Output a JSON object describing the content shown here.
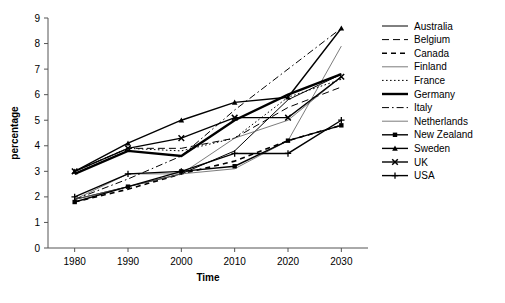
{
  "chart_data": {
    "type": "line",
    "title": "",
    "xlabel": "Time",
    "ylabel": "percentage",
    "x": [
      1980,
      1990,
      2000,
      2010,
      2020,
      2030
    ],
    "categories": [
      "1980",
      "1990",
      "2000",
      "2010",
      "2020",
      "2030"
    ],
    "xlim": [
      1975,
      2035
    ],
    "ylim": [
      0,
      9
    ],
    "yticks": [
      "0",
      "1",
      "2",
      "3",
      "4",
      "5",
      "6",
      "7",
      "8",
      "9"
    ],
    "grid": false,
    "legend_position": "right",
    "series": [
      {
        "name": "Australia",
        "style": "solid",
        "width": 1,
        "marker": "none",
        "values": [
          1.9,
          2.4,
          2.9,
          3.8,
          5.8,
          6.8
        ]
      },
      {
        "name": "Belgium",
        "style": "dashed",
        "width": 1,
        "marker": "none",
        "values": [
          3.0,
          3.9,
          3.9,
          4.3,
          5.5,
          6.3
        ]
      },
      {
        "name": "Canada",
        "style": "dash-thick",
        "width": 1.6,
        "marker": "none",
        "values": [
          1.8,
          2.3,
          2.9,
          3.4,
          4.2,
          4.8
        ]
      },
      {
        "name": "Finland",
        "style": "solid-thin",
        "width": 0.8,
        "marker": "none",
        "values": [
          1.9,
          2.9,
          2.9,
          3.1,
          4.2,
          7.9
        ]
      },
      {
        "name": "France",
        "style": "dotted",
        "width": 1,
        "marker": "none",
        "values": [
          3.0,
          3.9,
          3.8,
          4.3,
          5.9,
          6.6
        ]
      },
      {
        "name": "Germany",
        "style": "solid",
        "width": 2.4,
        "marker": "none",
        "values": [
          2.9,
          3.8,
          3.6,
          5.0,
          6.0,
          6.8
        ]
      },
      {
        "name": "Italy",
        "style": "dash-dot",
        "width": 1,
        "marker": "none",
        "values": [
          1.9,
          2.7,
          3.6,
          5.4,
          7.0,
          8.6
        ]
      },
      {
        "name": "Netherlands",
        "style": "solid-thin",
        "width": 0.8,
        "marker": "none",
        "values": [
          1.9,
          2.4,
          2.9,
          4.3,
          5.0,
          6.7
        ]
      },
      {
        "name": "New Zealand",
        "style": "solid",
        "width": 1.4,
        "marker": "square",
        "values": [
          1.8,
          2.4,
          3.0,
          3.2,
          4.2,
          4.8
        ]
      },
      {
        "name": "Sweden",
        "style": "solid",
        "width": 1.4,
        "marker": "triangle",
        "values": [
          3.0,
          4.1,
          5.0,
          5.7,
          5.9,
          8.6
        ]
      },
      {
        "name": "UK",
        "style": "solid",
        "width": 1.4,
        "marker": "cross-x",
        "values": [
          3.0,
          3.9,
          4.3,
          5.1,
          5.1,
          6.7
        ]
      },
      {
        "name": "USA",
        "style": "solid",
        "width": 1.4,
        "marker": "plus",
        "values": [
          2.0,
          2.9,
          3.0,
          3.7,
          3.7,
          5.0
        ]
      }
    ]
  }
}
